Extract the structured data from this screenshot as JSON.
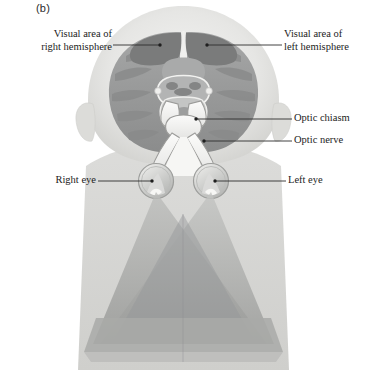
{
  "figure": {
    "panel_label": "(b)"
  },
  "callouts": [
    {
      "id": "visual-area-right-hemisphere",
      "text": "Visual area of\nright hemisphere",
      "side": "left",
      "target": "right occipital visual cortex"
    },
    {
      "id": "visual-area-left-hemisphere",
      "text": "Visual area of\nleft hemisphere",
      "side": "right",
      "target": "left occipital visual cortex"
    },
    {
      "id": "optic-chiasm",
      "text": "Optic chiasm",
      "side": "right",
      "target": "optic chiasm"
    },
    {
      "id": "optic-nerve",
      "text": "Optic nerve",
      "side": "right",
      "target": "left optic nerve"
    },
    {
      "id": "right-eye",
      "text": "Right eye",
      "side": "left",
      "target": "right eyeball"
    },
    {
      "id": "left-eye",
      "text": "Left eye",
      "side": "right",
      "target": "left eyeball"
    }
  ],
  "colors": {
    "background": "#ffffff",
    "label_text": "#1c1c1c",
    "leader_line": "#2d2d2d",
    "head_skin": "#e2e2e0",
    "head_skin_edge": "#d0d0cd",
    "shoulder": "#d5d5d3",
    "brain_light": "#9fa0a0",
    "brain_mid": "#8d8e8e",
    "visual_cortex_dark": "#7b7c7c",
    "brainstem": "#adaeae",
    "optic_tract": "#f2f2f0",
    "optic_tract_edge": "#9a9a98",
    "eye_fill": "#cfd0cf",
    "visual_field_cone_left": "#b9bab8",
    "visual_field_cone_right": "#aeafad",
    "visual_field_overlap": "#98999a"
  }
}
